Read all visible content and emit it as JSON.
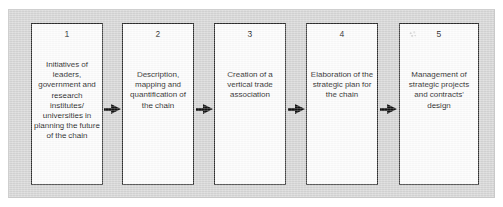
{
  "figure": {
    "kind": "process-flow-diagram",
    "orientation": "left-to-right",
    "panel_color": "#d6d6d6",
    "box_fill_color": "#fdfdfd",
    "box_border_color": "#2e2e2e",
    "arrow_color": "#111111",
    "stage_count": 5
  },
  "stages": [
    {
      "number": "1",
      "text": "Initiatives of leaders, government and research institutes/ universities in planning the future of the chain"
    },
    {
      "number": "2",
      "text": "Description, mapping and quantification of the chain"
    },
    {
      "number": "3",
      "text": "Creation of a vertical trade association"
    },
    {
      "number": "4",
      "text": "Elaboration of the strategic plan for the chain"
    },
    {
      "number": "5",
      "text": "Management of strategic projects and contracts' design"
    }
  ],
  "connectors": [
    {
      "name": "arrow-1-to-2",
      "from": "1",
      "to": "2",
      "glyph": "right-arrow"
    },
    {
      "name": "arrow-2-to-3",
      "from": "2",
      "to": "3",
      "glyph": "right-arrow"
    },
    {
      "name": "arrow-3-to-4",
      "from": "3",
      "to": "4",
      "glyph": "right-arrow"
    },
    {
      "name": "arrow-4-to-5",
      "from": "4",
      "to": "5",
      "glyph": "right-arrow"
    }
  ]
}
